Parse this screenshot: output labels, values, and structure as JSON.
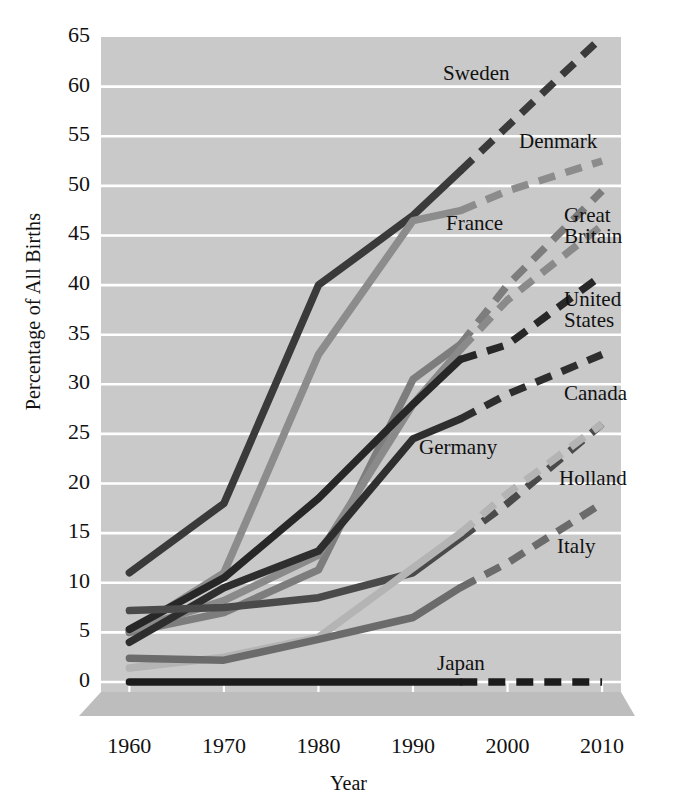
{
  "chart_data": {
    "type": "line",
    "title": "",
    "xlabel": "Year",
    "ylabel": "Percentage of All Births",
    "x": [
      1960,
      1970,
      1980,
      1990,
      1995,
      2000,
      2010
    ],
    "xlim": [
      1957,
      2012
    ],
    "ylim": [
      0,
      65
    ],
    "ytick_labels": [
      "0",
      "5",
      "10",
      "15",
      "20",
      "25",
      "30",
      "35",
      "40",
      "45",
      "50",
      "55",
      "60",
      "65"
    ],
    "ytick_values": [
      0,
      5,
      10,
      15,
      20,
      25,
      30,
      35,
      40,
      45,
      50,
      55,
      60,
      65
    ],
    "xtick_labels": [
      "1960",
      "1970",
      "1980",
      "1990",
      "2000",
      "2010"
    ],
    "xtick_values": [
      1960,
      1970,
      1980,
      1990,
      2000,
      2010
    ],
    "grid": "horizontal-white-on-gray",
    "legend": "inline-right-labels",
    "projection_starts": 1995,
    "plot_background": "#c9c9c9",
    "gridline_color": "#ffffff",
    "series": [
      {
        "name": "Sweden",
        "color": "#3a3a3a",
        "values": [
          11,
          18,
          40,
          47,
          51.5,
          56,
          65
        ],
        "label_x": 443,
        "label_y": 63
      },
      {
        "name": "Denmark",
        "color": "#8c8c8c",
        "values": [
          5,
          11,
          33,
          46.5,
          47.5,
          49.5,
          52.5
        ],
        "label_x": 519,
        "label_y": 131
      },
      {
        "name": "France",
        "color": "#7d7d7d",
        "values": [
          5,
          7,
          11.3,
          30.5,
          34,
          40,
          49.5
        ],
        "label_x": 446,
        "label_y": 213
      },
      {
        "name": "Great Britain",
        "color": "#8a8a8a",
        "values": [
          5.2,
          8.2,
          12.8,
          28,
          33.5,
          38.5,
          46
        ],
        "label_x": 564,
        "label_y": 205
      },
      {
        "name": "United States",
        "color": "#272727",
        "values": [
          5.3,
          10.5,
          18.5,
          28,
          32.5,
          34,
          41
        ],
        "label_x": 564,
        "label_y": 289
      },
      {
        "name": "Canada",
        "color": "#2e2e2e",
        "values": [
          4,
          9.5,
          13.2,
          24.5,
          26.5,
          29,
          33
        ],
        "label_x": 564,
        "label_y": 383
      },
      {
        "name": "Germany",
        "color": "#4a4a4a",
        "values": [
          7.2,
          7.5,
          8.5,
          11,
          14.5,
          18,
          26
        ],
        "label_x": 419,
        "label_y": 437
      },
      {
        "name": "Holland",
        "color": "#b4b4b4",
        "values": [
          1.4,
          2.5,
          4.5,
          11.5,
          15,
          19,
          26
        ],
        "label_x": 559,
        "label_y": 468
      },
      {
        "name": "Italy",
        "color": "#6b6b6b",
        "values": [
          2.4,
          2.2,
          4.3,
          6.5,
          9.5,
          12,
          18
        ],
        "label_x": 557,
        "label_y": 536
      },
      {
        "name": "Japan",
        "color": "#1c1c1c",
        "values": [
          0,
          0,
          0,
          0,
          0,
          0,
          0
        ],
        "label_x": 437,
        "label_y": 653
      }
    ]
  }
}
